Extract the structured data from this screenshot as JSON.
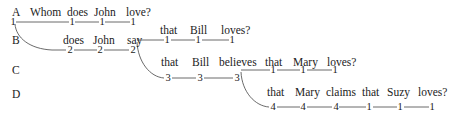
{
  "rows": [
    {
      "label": "A",
      "words": [
        "Whom",
        "does",
        "John",
        "love?"
      ],
      "indices": [
        "1",
        "1",
        "1",
        "1"
      ]
    },
    {
      "label": "B",
      "words": [
        "does",
        "John",
        "say",
        "that",
        "Bill",
        "loves?"
      ],
      "indices": [
        "2",
        "2",
        "2",
        "1",
        "1",
        "1"
      ]
    },
    {
      "label": "C",
      "words": [
        "that",
        "Bill",
        "believes",
        "that",
        "Mary",
        "loves?"
      ],
      "indices": [
        "3",
        "3",
        "3",
        "1",
        "1",
        "1"
      ]
    },
    {
      "label": "D",
      "words": [
        "that",
        "Mary",
        "claims",
        "that",
        "Suzy",
        "loves?"
      ],
      "indices": [
        "4",
        "4",
        "4",
        "1",
        "1",
        "1"
      ]
    }
  ]
}
